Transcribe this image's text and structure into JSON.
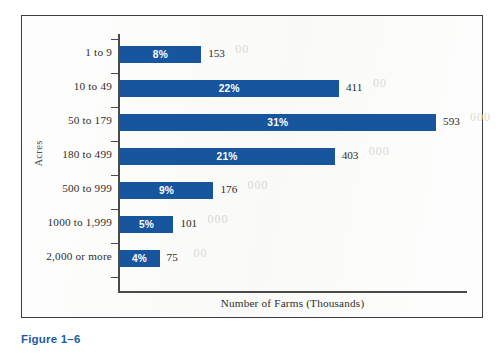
{
  "caption": "Figure 1–6",
  "colors": {
    "bar": "#17559e",
    "caption": "#1c5ba4",
    "axis": "#4a4a4a",
    "frame": "#3d3d3d",
    "bar_label": "#ffffff"
  },
  "chart_data": {
    "type": "bar",
    "orientation": "horizontal",
    "title": "",
    "xlabel": "Number of Farms (Thousands)",
    "ylabel": "Acres",
    "xlim": [
      0,
      650
    ],
    "grid": false,
    "legend": null,
    "categories": [
      "1 to 9",
      "10 to 49",
      "50 to 179",
      "180 to 499",
      "500 to 999",
      "1000 to 1,999",
      "2,000 or more"
    ],
    "values": [
      153,
      411,
      593,
      403,
      176,
      101,
      75
    ],
    "percents": [
      "8%",
      "22%",
      "31%",
      "21%",
      "9%",
      "5%",
      "4%"
    ],
    "value_labels": [
      "153",
      "411",
      "593",
      "403",
      "176",
      "101",
      "75"
    ],
    "rows": [
      {
        "category": "1 to 9",
        "value": 153,
        "value_label": "153",
        "percent": "8%"
      },
      {
        "category": "10 to 49",
        "value": 411,
        "value_label": "411",
        "percent": "22%"
      },
      {
        "category": "50 to 179",
        "value": 593,
        "value_label": "593",
        "percent": "31%"
      },
      {
        "category": "180 to 499",
        "value": 403,
        "value_label": "403",
        "percent": "21%"
      },
      {
        "category": "500 to 999",
        "value": 176,
        "value_label": "176",
        "percent": "9%"
      },
      {
        "category": "1000 to 1,999",
        "value": 101,
        "value_label": "101",
        "percent": "5%"
      },
      {
        "category": "2,000 or more",
        "value": 75,
        "value_label": "75",
        "percent": "4%"
      }
    ]
  },
  "ghost_marks": [
    "00",
    "00",
    "000",
    "000",
    "000",
    "000",
    "00"
  ]
}
